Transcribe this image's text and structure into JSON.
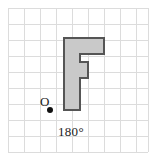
{
  "figure": {
    "type": "geometry-rotation-diagram",
    "background_color": "#ffffff"
  },
  "grid": {
    "name": "square-grid",
    "line_color": "#dcdcdc",
    "cell_size": 16,
    "origin_x": 8,
    "origin_y": 8,
    "columns": 9,
    "rows": 9,
    "width": 144,
    "height": 144
  },
  "shape": {
    "letter": "F",
    "fill_color": "#c9c9c9",
    "stroke_color": "#555555",
    "stroke_width": 2,
    "points": "64,38 104,38 104,54 80,54 80,62 88,62 88,78 80,78 80,110 64,110"
  },
  "center_of_rotation": {
    "label": "O",
    "dot_color": "#111111",
    "dot_radius": 3,
    "dot_x": 50,
    "dot_y": 110
  },
  "annotation": {
    "angle_label": "180°"
  }
}
